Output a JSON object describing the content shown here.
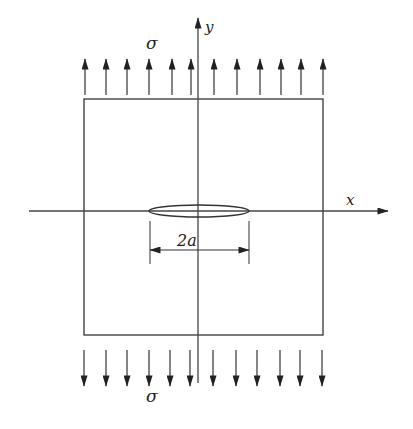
{
  "diagram": {
    "type": "plate-with-central-crack",
    "colors": {
      "stroke": "#333333",
      "text": "#222222",
      "background": "#ffffff"
    },
    "labels": {
      "stress_top": "σ",
      "stress_bottom": "σ",
      "x_axis": "x",
      "y_axis": "y",
      "crack_length": "2a"
    },
    "plate": {
      "left": 84,
      "top": 99,
      "right": 323,
      "bottom": 335
    },
    "axes": {
      "x": {
        "y": 211,
        "x_start": 29,
        "x_end": 388
      },
      "y": {
        "x": 198,
        "y_start": 383,
        "y_end": 18
      }
    },
    "crack": {
      "cx": 199,
      "cy": 211,
      "rx": 50,
      "ry": 6
    },
    "dimension": {
      "x1": 150,
      "x2": 249,
      "y": 250,
      "ext_top": 221,
      "ext_bottom": 264
    },
    "arrows_top": {
      "count": 12,
      "xs": [
        85,
        106,
        127,
        149,
        172,
        191,
        214,
        237,
        260,
        281,
        301,
        323
      ],
      "tail_y": 95,
      "tip_y": 59
    },
    "arrows_bottom": {
      "count": 12,
      "xs": [
        84,
        106,
        127,
        149,
        170,
        190,
        213,
        236,
        257,
        280,
        300,
        322
      ],
      "tail_y": 350,
      "tip_y": 386
    }
  }
}
